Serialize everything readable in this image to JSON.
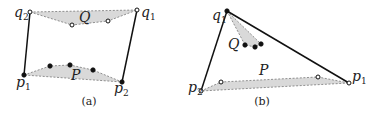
{
  "panels": [
    {
      "id": "a",
      "caption": "(a)",
      "caption_pos": [
        89,
        105
      ],
      "segments": [
        {
          "from": [
            30,
            12
          ],
          "to": [
            24,
            75
          ]
        },
        {
          "from": [
            137,
            10
          ],
          "to": [
            122,
            82
          ]
        }
      ],
      "hulls": [
        {
          "name": "Q",
          "points": [
            [
              30,
              12
            ],
            [
              137,
              10
            ],
            [
              108,
              21
            ],
            [
              72,
              25
            ]
          ]
        },
        {
          "name": "P",
          "points": [
            [
              24,
              75
            ],
            [
              50,
              66
            ],
            [
              70,
              65
            ],
            [
              93,
              70
            ],
            [
              122,
              82
            ]
          ]
        }
      ],
      "open_points": [
        [
          30,
          12
        ],
        [
          137,
          10
        ],
        [
          72,
          25
        ],
        [
          108,
          21
        ]
      ],
      "filled_points": [
        [
          24,
          75
        ],
        [
          122,
          82
        ],
        [
          50,
          66
        ],
        [
          70,
          65
        ],
        [
          93,
          70
        ]
      ],
      "labels": [
        {
          "text": "q",
          "sub": "2",
          "x": 14,
          "y": 17
        },
        {
          "text": "Q",
          "sub": "",
          "x": 79,
          "y": 22
        },
        {
          "text": "q",
          "sub": "1",
          "x": 141,
          "y": 17
        },
        {
          "text": "P",
          "sub": "",
          "x": 71,
          "y": 80
        },
        {
          "text": "p",
          "sub": "1",
          "x": 16,
          "y": 87
        },
        {
          "text": "p",
          "sub": "2",
          "x": 114,
          "y": 93
        }
      ]
    },
    {
      "id": "b",
      "caption": "(b)",
      "caption_pos": [
        262,
        105
      ],
      "segments": [
        {
          "from": [
            227,
            11
          ],
          "to": [
            201,
            91
          ]
        },
        {
          "from": [
            227,
            11
          ],
          "to": [
            349,
            83
          ]
        }
      ],
      "hulls": [
        {
          "name": "Q",
          "points": [
            [
              227,
              11
            ],
            [
              261,
              44
            ],
            [
              255,
              47
            ],
            [
              245,
              45
            ]
          ]
        },
        {
          "name": "P",
          "points": [
            [
              201,
              91
            ],
            [
              221,
              82
            ],
            [
              318,
              77
            ],
            [
              349,
              83
            ]
          ]
        }
      ],
      "open_points": [
        [
          201,
          91
        ],
        [
          349,
          83
        ],
        [
          221,
          82
        ],
        [
          318,
          77
        ]
      ],
      "filled_points": [
        [
          227,
          11
        ],
        [
          245,
          45
        ],
        [
          255,
          47
        ],
        [
          261,
          44
        ]
      ],
      "labels": [
        {
          "text": "q",
          "sub": "1",
          "x": 212,
          "y": 20
        },
        {
          "text": "Q",
          "sub": "",
          "x": 228,
          "y": 49
        },
        {
          "text": "P",
          "sub": "",
          "x": 259,
          "y": 75
        },
        {
          "text": "p",
          "sub": "1",
          "x": 352,
          "y": 81
        },
        {
          "text": "p",
          "sub": "2",
          "x": 188,
          "y": 92
        }
      ]
    }
  ]
}
